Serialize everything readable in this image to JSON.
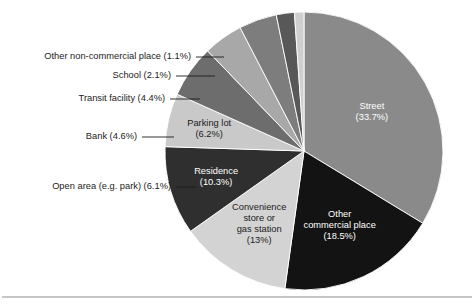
{
  "figure": {
    "background_color": "#ffffff",
    "rule_color": "#8e8e93",
    "label_text_color": "#1b1b1b"
  },
  "chart_data": {
    "type": "pie",
    "title": "",
    "subtitle": "",
    "xlabel": "",
    "ylabel": "",
    "legend_position": "none",
    "grid": false,
    "units": "percent",
    "start_angle_deg": 0,
    "direction": "clockwise",
    "center": {
      "x": 304,
      "y": 151
    },
    "radius": 139,
    "categories": [
      "Street",
      "Other commercial place",
      "Convenience store or gas station",
      "Residence",
      "Parking lot",
      "Open area (e.g. park)",
      "Bank",
      "Transit facility",
      "School",
      "Other non-commercial place"
    ],
    "values": [
      33.7,
      18.5,
      13,
      10.3,
      6.2,
      6.1,
      4.6,
      4.4,
      2.1,
      1.1
    ],
    "value_labels": [
      "33.7%",
      "18.5%",
      "13%",
      "10.3%",
      "6.2%",
      "6.1%",
      "4.6%",
      "4.4%",
      "2.1%",
      "1.1%"
    ],
    "colors": [
      "#8a8a8a",
      "#131313",
      "#d3d3d3",
      "#2f2f2f",
      "#c9c9c9",
      "#6d6d6d",
      "#a8a8a8",
      "#7d7d7d",
      "#585858",
      "#cfcfcf"
    ],
    "slices": [
      {
        "name": "Street",
        "value": 33.7,
        "label": "Street",
        "value_label": "(33.7%)",
        "color": "#8a8a8a",
        "label_placement": "inside",
        "text_color": "#ffffff",
        "label_lines": [
          "Street",
          "(33.7%)"
        ]
      },
      {
        "name": "Other commercial place",
        "value": 18.5,
        "label": "Other commercial place",
        "value_label": "(18.5%)",
        "color": "#131313",
        "label_placement": "inside",
        "text_color": "#ffffff",
        "label_lines": [
          "Other",
          "commercial place",
          "(18.5%)"
        ]
      },
      {
        "name": "Convenience store or gas station",
        "value": 13,
        "label": "Convenience store or gas station",
        "value_label": "(13%)",
        "color": "#d3d3d3",
        "label_placement": "inside",
        "text_color": "#1b1b1b",
        "label_lines": [
          "Convenience",
          "store or",
          "gas station",
          "(13%)"
        ]
      },
      {
        "name": "Residence",
        "value": 10.3,
        "label": "Residence",
        "value_label": "(10.3%)",
        "color": "#2f2f2f",
        "label_placement": "inside",
        "text_color": "#ffffff",
        "label_lines": [
          "Residence",
          "(10.3%)"
        ]
      },
      {
        "name": "Parking lot",
        "value": 6.2,
        "label": "Parking lot",
        "value_label": "(6.2%)",
        "color": "#c9c9c9",
        "label_placement": "inside",
        "text_color": "#1b1b1b",
        "label_lines": [
          "Parking lot",
          "(6.2%)"
        ]
      },
      {
        "name": "Open area (e.g. park)",
        "value": 6.1,
        "label": "Open area (e.g. park)",
        "value_label": "(6.1%)",
        "color": "#6d6d6d",
        "label_placement": "callout",
        "text_color": "#1b1b1b",
        "callout_text": "Open area (e.g. park) (6.1%)"
      },
      {
        "name": "Bank",
        "value": 4.6,
        "label": "Bank",
        "value_label": "(4.6%)",
        "color": "#a8a8a8",
        "label_placement": "callout",
        "text_color": "#1b1b1b",
        "callout_text": "Bank (4.6%)"
      },
      {
        "name": "Transit facility",
        "value": 4.4,
        "label": "Transit facility",
        "value_label": "(4.4%)",
        "color": "#7d7d7d",
        "label_placement": "callout",
        "text_color": "#1b1b1b",
        "callout_text": "Transit facility (4.4%)"
      },
      {
        "name": "School",
        "value": 2.1,
        "label": "School",
        "value_label": "(2.1%)",
        "color": "#585858",
        "label_placement": "callout",
        "text_color": "#1b1b1b",
        "callout_text": "School (2.1%)"
      },
      {
        "name": "Other non-commercial place",
        "value": 1.1,
        "label": "Other non-commercial place",
        "value_label": "(1.1%)",
        "color": "#cfcfcf",
        "label_placement": "callout",
        "text_color": "#1b1b1b",
        "callout_text": "Other non-commercial place (1.1%)"
      }
    ],
    "callout_layout": [
      {
        "name": "Other non-commercial place",
        "text_x": 191,
        "text_y": 57,
        "line_x1": 196,
        "line_x2": 224
      },
      {
        "name": "School",
        "text_x": 171,
        "text_y": 76,
        "line_x1": 176,
        "line_x2": 215
      },
      {
        "name": "Transit facility",
        "text_x": 165,
        "text_y": 99,
        "line_x1": 170,
        "line_x2": 200
      },
      {
        "name": "Bank",
        "text_x": 137,
        "text_y": 137,
        "line_x1": 142,
        "line_x2": 174
      },
      {
        "name": "Open area (e.g. park)",
        "text_x": 171,
        "text_y": 187,
        "line_x1": 176,
        "line_x2": 196
      }
    ]
  }
}
